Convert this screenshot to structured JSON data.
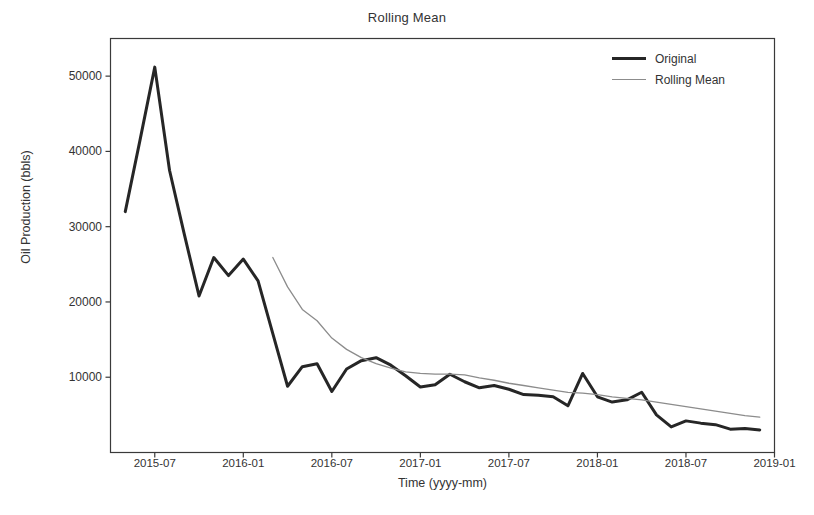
{
  "chart_data": {
    "type": "line",
    "title": "Rolling Mean",
    "xlabel": "Time (yyyy-mm)",
    "ylabel": "Oil Production (bbls)",
    "grid": false,
    "legend_position": "top-right",
    "xlim": [
      "2015-04",
      "2019-01"
    ],
    "ylim": [
      0,
      55000
    ],
    "ytick_labels": [
      "10000",
      "20000",
      "30000",
      "40000",
      "50000"
    ],
    "ytick_values": [
      10000,
      20000,
      30000,
      40000,
      50000
    ],
    "xtick_labels": [
      "2015-07",
      "2016-01",
      "2016-07",
      "2017-01",
      "2017-07",
      "2018-01",
      "2018-07",
      "2019-01"
    ],
    "x": [
      "2015-05",
      "2015-06",
      "2015-07",
      "2015-08",
      "2015-09",
      "2015-10",
      "2015-11",
      "2015-12",
      "2016-01",
      "2016-02",
      "2016-03",
      "2016-04",
      "2016-05",
      "2016-06",
      "2016-07",
      "2016-08",
      "2016-09",
      "2016-10",
      "2016-11",
      "2016-12",
      "2017-01",
      "2017-02",
      "2017-03",
      "2017-04",
      "2017-05",
      "2017-06",
      "2017-07",
      "2017-08",
      "2017-09",
      "2017-10",
      "2017-11",
      "2017-12",
      "2018-01",
      "2018-02",
      "2018-03",
      "2018-04",
      "2018-05",
      "2018-06",
      "2018-07",
      "2018-08",
      "2018-09",
      "2018-10",
      "2018-11",
      "2018-12"
    ],
    "series": [
      {
        "name": "Original",
        "color": "#262626",
        "linewidth": 3,
        "values": [
          32000,
          41500,
          51200,
          37500,
          29000,
          20800,
          25900,
          23500,
          25700,
          22800,
          15800,
          8800,
          11400,
          11800,
          8100,
          11100,
          12200,
          12600,
          11600,
          10200,
          8700,
          9000,
          10400,
          9400,
          8600,
          8900,
          8400,
          7700,
          7600,
          7400,
          6200,
          10500,
          7400,
          6700,
          7000,
          8000,
          5000,
          3400,
          4200,
          3900,
          3700,
          3100,
          3200,
          3000
        ]
      },
      {
        "name": "Rolling Mean",
        "color": "#8c8c8c",
        "linewidth": 1.3,
        "start_index": 10,
        "values": [
          null,
          null,
          null,
          null,
          null,
          null,
          null,
          null,
          null,
          null,
          25900,
          22000,
          19000,
          17500,
          15200,
          13700,
          12600,
          11800,
          11200,
          10700,
          10500,
          10400,
          10400,
          10300,
          9900,
          9600,
          9200,
          8900,
          8600,
          8300,
          8000,
          7900,
          7700,
          7400,
          7200,
          7000,
          6700,
          6400,
          6100,
          5800,
          5500,
          5200,
          4900,
          4700
        ]
      }
    ]
  },
  "legend": {
    "entries": [
      {
        "label": "Original"
      },
      {
        "label": "Rolling Mean"
      }
    ]
  }
}
